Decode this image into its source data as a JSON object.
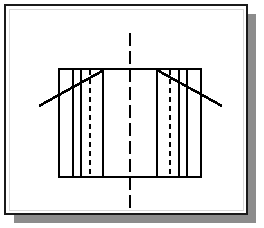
{
  "canvas": {
    "width": 264,
    "height": 228,
    "background": "#ffffff"
  },
  "page": {
    "name": "drawing-sheet",
    "x": 5,
    "y": 5,
    "width": 242,
    "height": 209,
    "fill": "#ffffff",
    "border_color": "#1a1a1a",
    "border_width": 1.6,
    "inner_border_color": "#d8d8d8"
  },
  "shadow": {
    "name": "sheet-drop-shadow",
    "offset_x": 9,
    "offset_y": 9,
    "color": "#8c8c8c",
    "edge_color": "#6f6f6f"
  },
  "drawing": {
    "title": "Symmetric Sectioned Part - Front View",
    "stroke_color": "#000000",
    "thick_width": 2.6,
    "medium_width": 1.9,
    "thin_width": 1.1,
    "hidden_width": 1.1,
    "center_width": 1.1,
    "hidden_dash": "5,4",
    "center_dash": "13,5",
    "body": {
      "name": "part-outline",
      "left": 59,
      "right": 201,
      "top": 69,
      "bottom": 177,
      "width": 142,
      "height": 108
    },
    "vertical_lines": [
      {
        "name": "thick-rib-left-outer",
        "x": 73,
        "weight": "medium"
      },
      {
        "name": "thin-flange-left",
        "x": 81,
        "weight": "thin"
      },
      {
        "name": "thick-web-left-inner",
        "x": 103,
        "weight": "medium"
      },
      {
        "name": "thick-web-right-inner",
        "x": 157,
        "weight": "medium"
      },
      {
        "name": "thin-flange-right",
        "x": 179,
        "weight": "thin"
      },
      {
        "name": "thick-rib-right-outer",
        "x": 187,
        "weight": "medium"
      }
    ],
    "hidden_lines": [
      {
        "name": "hidden-bore-left",
        "x": 90,
        "y1": 70,
        "y2": 176
      },
      {
        "name": "hidden-bore-right",
        "x": 170,
        "y1": 70,
        "y2": 176
      }
    ],
    "center_line": {
      "name": "vertical-center-axis",
      "x": 130,
      "y1": 33,
      "y2": 212
    },
    "leader_lines": [
      {
        "name": "leader-line-left",
        "x1": 39,
        "y1": 106,
        "x2": 104,
        "y2": 70,
        "weight": "thick"
      },
      {
        "name": "leader-line-right",
        "x1": 222,
        "y1": 106,
        "x2": 157,
        "y2": 70,
        "weight": "thick"
      }
    ]
  },
  "labels": {
    "sheet_caption": "",
    "dimension_text": "",
    "note_text": ""
  }
}
